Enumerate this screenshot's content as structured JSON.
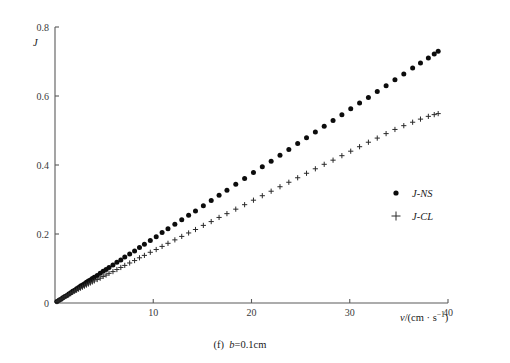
{
  "figure": {
    "caption": "(f)  b=0.1cm",
    "caption_label": "(f)",
    "caption_value": "b=0.1cm"
  },
  "axes": {
    "y_title": "J",
    "x_title_main": "v/(cm · s",
    "x_title_sup": "−1",
    "x_title_close": ")",
    "x_title_full": "v/(cm · s⁻¹)",
    "x_ticks": [
      "10",
      "20",
      "30",
      "40"
    ],
    "y_ticks": [
      "0",
      "0.2",
      "0.4",
      "0.6",
      "0.8"
    ]
  },
  "legend": {
    "entries": [
      {
        "label": "J-NS",
        "marker": "filled-circle-marker"
      },
      {
        "label": "J-CL",
        "marker": "plus-marker"
      }
    ]
  },
  "chart_data": {
    "type": "scatter",
    "title": "",
    "subtitle": "(f)  b=0.1cm",
    "xlabel": "v/(cm · s⁻¹)",
    "ylabel": "J",
    "xlim": [
      0,
      40
    ],
    "ylim": [
      0,
      0.8
    ],
    "xticks": [
      10,
      20,
      30,
      40
    ],
    "yticks": [
      0,
      0.2,
      0.4,
      0.6,
      0.8
    ],
    "grid": false,
    "legend_position": "center-right",
    "series": [
      {
        "name": "J-NS",
        "marker": "filled-circle",
        "color": "#0c0c0c",
        "x": [
          0.2,
          0.4,
          0.6,
          0.8,
          1.0,
          1.2,
          1.4,
          1.6,
          1.8,
          2.0,
          2.2,
          2.4,
          2.6,
          2.8,
          3.0,
          3.2,
          3.4,
          3.6,
          3.8,
          4.0,
          4.3,
          4.6,
          4.9,
          5.2,
          5.5,
          5.9,
          6.3,
          6.7,
          7.1,
          7.6,
          8.1,
          8.6,
          9.1,
          9.7,
          10.3,
          10.9,
          11.5,
          12.2,
          12.9,
          13.6,
          14.3,
          15.1,
          15.9,
          16.7,
          17.5,
          18.4,
          19.3,
          20.2,
          21.1,
          22.0,
          22.9,
          23.8,
          24.7,
          25.6,
          26.5,
          27.4,
          28.3,
          29.2,
          30.1,
          31.0,
          31.9,
          32.8,
          33.7,
          34.6,
          35.5,
          36.4,
          37.2,
          38.0,
          38.6,
          39.0
        ],
        "y": [
          0.004,
          0.008,
          0.011,
          0.015,
          0.019,
          0.022,
          0.026,
          0.03,
          0.034,
          0.037,
          0.041,
          0.045,
          0.049,
          0.052,
          0.056,
          0.06,
          0.064,
          0.067,
          0.071,
          0.075,
          0.08,
          0.086,
          0.092,
          0.097,
          0.103,
          0.11,
          0.118,
          0.125,
          0.133,
          0.142,
          0.151,
          0.161,
          0.17,
          0.181,
          0.192,
          0.204,
          0.215,
          0.228,
          0.241,
          0.254,
          0.267,
          0.282,
          0.297,
          0.312,
          0.327,
          0.344,
          0.361,
          0.378,
          0.395,
          0.411,
          0.428,
          0.445,
          0.462,
          0.479,
          0.496,
          0.512,
          0.529,
          0.546,
          0.563,
          0.58,
          0.596,
          0.613,
          0.63,
          0.647,
          0.664,
          0.681,
          0.696,
          0.71,
          0.722,
          0.73
        ],
        "slope_estimate": 0.0187
      },
      {
        "name": "J-CL",
        "marker": "plus",
        "color": "#2a2a2a",
        "x": [
          0.2,
          0.4,
          0.6,
          0.8,
          1.0,
          1.2,
          1.4,
          1.6,
          1.8,
          2.0,
          2.2,
          2.4,
          2.6,
          2.8,
          3.0,
          3.2,
          3.4,
          3.6,
          3.8,
          4.0,
          4.3,
          4.6,
          4.9,
          5.2,
          5.5,
          5.9,
          6.3,
          6.7,
          7.1,
          7.6,
          8.1,
          8.6,
          9.1,
          9.7,
          10.3,
          10.9,
          11.5,
          12.2,
          12.9,
          13.6,
          14.3,
          15.1,
          15.9,
          16.7,
          17.5,
          18.4,
          19.3,
          20.2,
          21.1,
          22.0,
          22.9,
          23.8,
          24.7,
          25.6,
          26.5,
          27.4,
          28.3,
          29.2,
          30.1,
          31.0,
          31.9,
          32.8,
          33.7,
          34.6,
          35.5,
          36.4,
          37.2,
          38.0,
          38.6,
          39.0
        ],
        "y": [
          0.004,
          0.008,
          0.011,
          0.014,
          0.018,
          0.021,
          0.024,
          0.027,
          0.031,
          0.034,
          0.037,
          0.04,
          0.043,
          0.046,
          0.049,
          0.052,
          0.055,
          0.058,
          0.061,
          0.064,
          0.068,
          0.072,
          0.077,
          0.081,
          0.086,
          0.091,
          0.097,
          0.103,
          0.109,
          0.116,
          0.123,
          0.131,
          0.138,
          0.147,
          0.155,
          0.164,
          0.173,
          0.183,
          0.193,
          0.203,
          0.213,
          0.225,
          0.236,
          0.248,
          0.259,
          0.272,
          0.285,
          0.298,
          0.311,
          0.324,
          0.337,
          0.35,
          0.363,
          0.376,
          0.389,
          0.402,
          0.414,
          0.427,
          0.44,
          0.453,
          0.466,
          0.478,
          0.491,
          0.503,
          0.514,
          0.524,
          0.533,
          0.541,
          0.546,
          0.549
        ],
        "slope_estimate": 0.0126
      }
    ]
  },
  "geometry": {
    "plot_left": 55,
    "plot_right": 448,
    "plot_bottom": 303,
    "plot_top": 27,
    "legend_x": 392,
    "legend_y1": 196,
    "legend_y2": 218
  }
}
